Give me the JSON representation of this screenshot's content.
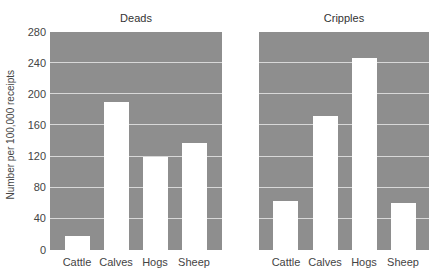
{
  "chart_data": [
    {
      "type": "bar",
      "title": "Deads",
      "categories": [
        "Cattle",
        "Calves",
        "Hogs",
        "Sheep"
      ],
      "values": [
        18,
        190,
        120,
        138
      ],
      "xlabel": "",
      "ylabel": "Number per 100,000 receipts",
      "ylim": [
        0,
        280
      ],
      "yticks": [
        0,
        40,
        80,
        120,
        160,
        200,
        240,
        280
      ],
      "grid": true
    },
    {
      "type": "bar",
      "title": "Cripples",
      "categories": [
        "Cattle",
        "Calves",
        "Hogs",
        "Sheep"
      ],
      "values": [
        63,
        172,
        246,
        61
      ],
      "xlabel": "",
      "ylabel": "",
      "ylim": [
        0,
        280
      ],
      "grid": true
    }
  ],
  "labels": {
    "left_title": "Deads",
    "right_title": "Cripples",
    "ylabel": "Number per 100,000 receipts",
    "yticks": [
      "280",
      "240",
      "200",
      "160",
      "120",
      "80",
      "40",
      "0"
    ],
    "categories": [
      "Cattle",
      "Calves",
      "Hogs",
      "Sheep"
    ]
  },
  "colors": {
    "panel_bg": "#8e8e8e",
    "bar": "#ffffff",
    "gridline": "#d8d8d8"
  }
}
